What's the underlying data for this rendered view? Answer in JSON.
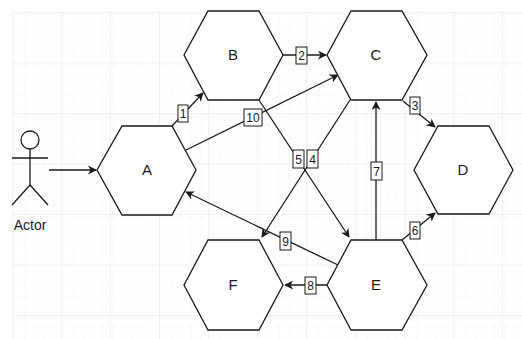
{
  "diagram": {
    "colors": {
      "background": "#ffffff",
      "grid_minor": "#f3f3f3",
      "grid_major": "#e4e4e4",
      "stroke": "#1a1a1a",
      "label_fill": "#ffffff"
    },
    "actor": {
      "label": "Actor"
    },
    "nodes": [
      {
        "id": "A",
        "label": "A"
      },
      {
        "id": "B",
        "label": "B"
      },
      {
        "id": "C",
        "label": "C"
      },
      {
        "id": "D",
        "label": "D"
      },
      {
        "id": "E",
        "label": "E"
      },
      {
        "id": "F",
        "label": "F"
      }
    ],
    "edges": [
      {
        "from": "Actor",
        "to": "A",
        "label": ""
      },
      {
        "from": "A",
        "to": "B",
        "label": "1"
      },
      {
        "from": "B",
        "to": "C",
        "label": "2"
      },
      {
        "from": "C",
        "to": "D",
        "label": "3"
      },
      {
        "from": "C",
        "to": "F",
        "label": "4"
      },
      {
        "from": "B",
        "to": "E",
        "label": "5"
      },
      {
        "from": "E",
        "to": "D",
        "label": "6"
      },
      {
        "from": "E",
        "to": "C",
        "label": "7"
      },
      {
        "from": "E",
        "to": "F",
        "label": "8"
      },
      {
        "from": "E",
        "to": "A",
        "label": "9"
      },
      {
        "from": "A",
        "to": "C",
        "label": "10"
      }
    ]
  }
}
